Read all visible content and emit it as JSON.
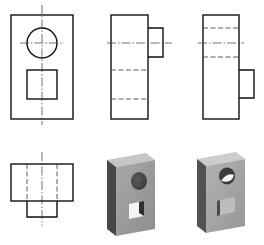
{
  "diagram": {
    "type": "orthographic-projection-exercise",
    "stroke_color": "#111111",
    "centerline_color": "#333333",
    "hidden_line_color": "#333333",
    "views": [
      {
        "id": "front-view",
        "position": "top-left",
        "outline": {
          "x": 11,
          "y": 15,
          "w": 62,
          "h": 104
        },
        "circle": {
          "cx": 42,
          "cy": 43,
          "r": 15
        },
        "square": {
          "x": 27,
          "y": 70,
          "w": 30,
          "h": 29
        },
        "centerline_vertical": {
          "x": 42,
          "y1": 5,
          "y2": 125
        },
        "centerline_horizontal": {
          "y": 43,
          "x1": 20,
          "x2": 64
        }
      },
      {
        "id": "side-view-a",
        "position": "top-middle",
        "outline": {
          "x": 111,
          "y": 15,
          "w": 37,
          "h": 104
        },
        "tab": {
          "x": 148,
          "y": 28,
          "w": 15,
          "h": 29
        },
        "centerline_horizontal": {
          "y": 43,
          "x1": 107,
          "x2": 172
        },
        "hidden_lines_y": [
          70,
          99
        ]
      },
      {
        "id": "side-view-b",
        "position": "top-right",
        "outline": {
          "x": 203,
          "y": 15,
          "w": 36,
          "h": 104
        },
        "tab": {
          "x": 239,
          "y": 70,
          "w": 15,
          "h": 28
        },
        "centerline_horizontal": {
          "y": 43,
          "x1": 198,
          "x2": 244
        },
        "hidden_lines_y": [
          28,
          57
        ]
      },
      {
        "id": "bottom-view",
        "position": "bottom-left",
        "outline": {
          "x": 11,
          "y": 164,
          "w": 62,
          "h": 37
        },
        "tab": {
          "x": 27,
          "y": 201,
          "w": 30,
          "h": 16
        },
        "centerline_vertical": {
          "x": 42,
          "y1": 152,
          "y2": 226
        },
        "hidden_lines_x": [
          27,
          57
        ]
      }
    ],
    "isometric_models": [
      {
        "id": "model-a",
        "position": "bottom-middle",
        "face_color": "#9a9a9a",
        "top_color": "#c4c4c4",
        "side_color": "#4a4a4a",
        "hole": "round-hole-and-square-through-hole"
      },
      {
        "id": "model-b",
        "position": "bottom-right",
        "face_color": "#a5a5a5",
        "top_color": "#cbcbcb",
        "side_color": "#555555",
        "hole": "round-through-hole-and-square-boss"
      }
    ]
  }
}
